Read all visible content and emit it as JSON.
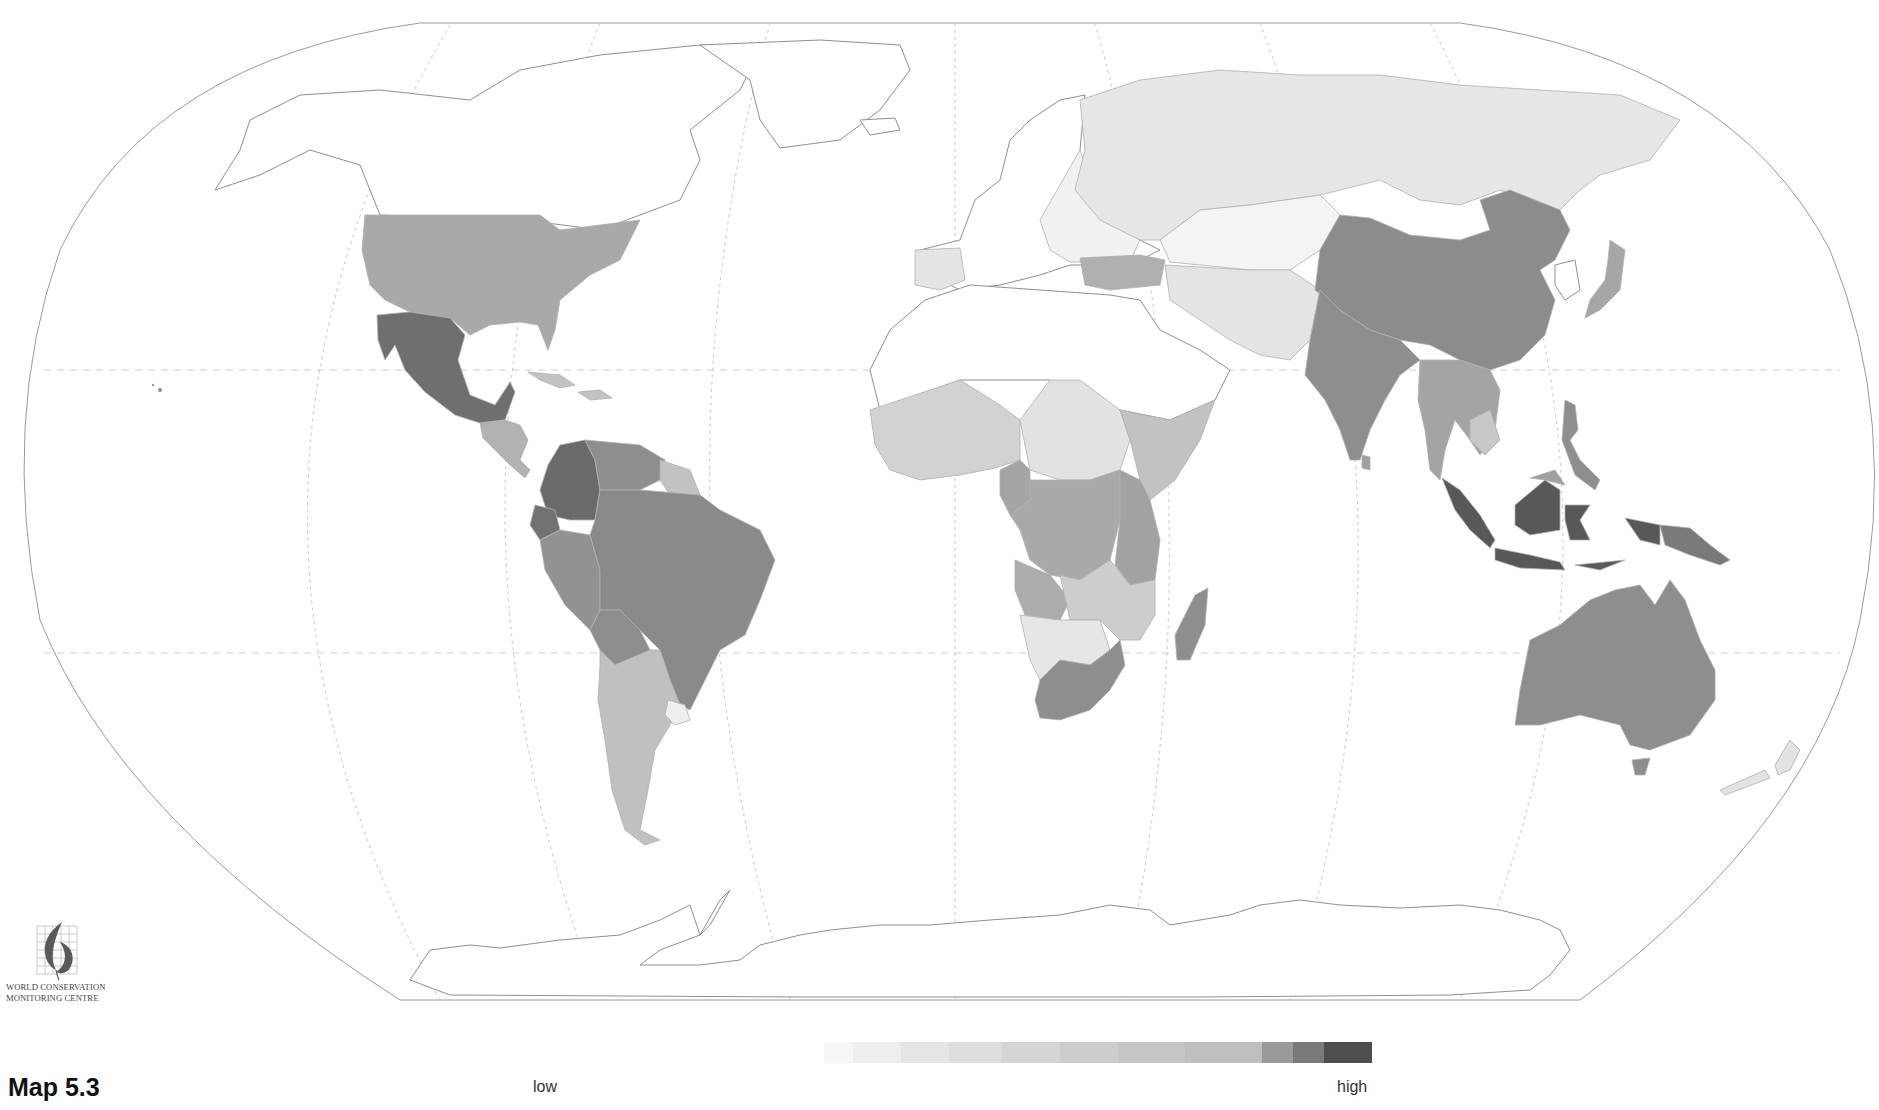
{
  "map": {
    "caption": "Map 5.3",
    "projection": "Robinson-like world projection",
    "graticule": [
      "equator",
      "tropic-of-cancer",
      "tropic-of-capricorn",
      "meridians"
    ],
    "shade_classes": {
      "none": "#ffffff",
      "c1": "#f2f2f2",
      "c2": "#e4e4e4",
      "c3": "#d2d2d2",
      "c4": "#c2c2c2",
      "c5": "#a9a9a9",
      "c6": "#8e8e8e",
      "c7": "#6f6f6f",
      "c8": "#585858"
    },
    "regions": [
      {
        "name": "Canada/Greenland/Alaska",
        "class": "none"
      },
      {
        "name": "United States",
        "class": "c5"
      },
      {
        "name": "Mexico",
        "class": "c7"
      },
      {
        "name": "Central America",
        "class": "c5"
      },
      {
        "name": "Caribbean",
        "class": "c4"
      },
      {
        "name": "Colombia",
        "class": "c7"
      },
      {
        "name": "Venezuela",
        "class": "c6"
      },
      {
        "name": "Guianas",
        "class": "c4"
      },
      {
        "name": "Ecuador",
        "class": "c7"
      },
      {
        "name": "Peru",
        "class": "c6"
      },
      {
        "name": "Brazil",
        "class": "c6"
      },
      {
        "name": "Bolivia",
        "class": "c6"
      },
      {
        "name": "Paraguay",
        "class": "c4"
      },
      {
        "name": "Argentina/Chile",
        "class": "c4"
      },
      {
        "name": "Uruguay",
        "class": "c1"
      },
      {
        "name": "Western Europe",
        "class": "none"
      },
      {
        "name": "Iberia",
        "class": "c2"
      },
      {
        "name": "Eastern Europe",
        "class": "c1"
      },
      {
        "name": "Turkey",
        "class": "c5"
      },
      {
        "name": "Russia",
        "class": "c2"
      },
      {
        "name": "Central Asia",
        "class": "c1"
      },
      {
        "name": "Iran/Afghanistan/Pakistan",
        "class": "c2"
      },
      {
        "name": "North Africa / Arabia",
        "class": "none"
      },
      {
        "name": "West Africa",
        "class": "c3"
      },
      {
        "name": "Sudan/Chad",
        "class": "c2"
      },
      {
        "name": "Ethiopia",
        "class": "c4"
      },
      {
        "name": "Cameroon/Central Africa",
        "class": "c5"
      },
      {
        "name": "Zaire",
        "class": "c5"
      },
      {
        "name": "East Africa",
        "class": "c5"
      },
      {
        "name": "Angola",
        "class": "c5"
      },
      {
        "name": "Zambia/Mozambique",
        "class": "c3"
      },
      {
        "name": "Namibia/Botswana",
        "class": "c2"
      },
      {
        "name": "South Africa",
        "class": "c6"
      },
      {
        "name": "Madagascar",
        "class": "c6"
      },
      {
        "name": "China",
        "class": "c6"
      },
      {
        "name": "India",
        "class": "c6"
      },
      {
        "name": "Southeast Asia",
        "class": "c5"
      },
      {
        "name": "Japan",
        "class": "c5"
      },
      {
        "name": "Philippines",
        "class": "c6"
      },
      {
        "name": "Indonesia",
        "class": "c8"
      },
      {
        "name": "Papua New Guinea",
        "class": "c7"
      },
      {
        "name": "Australia",
        "class": "c6"
      },
      {
        "name": "New Zealand",
        "class": "c2"
      },
      {
        "name": "Antarctica",
        "class": "none"
      }
    ]
  },
  "logo": {
    "line1": "WORLD CONSERVATION",
    "line2": "MONITORING CENTRE"
  },
  "legend": {
    "low_label": "low",
    "high_label": "high",
    "steps": [
      "#ffffff",
      "#f6f6f6",
      "#eeeeee",
      "#e5e5e5",
      "#dddddd",
      "#d5d5d5",
      "#cdcdcd",
      "#c6c6c6",
      "#bfbfbf",
      "#9a9a9a",
      "#7a7a7a",
      "#4e4e4e"
    ],
    "step_widths": [
      30,
      30,
      50,
      50,
      55,
      60,
      60,
      70,
      80,
      32,
      32,
      50
    ]
  }
}
